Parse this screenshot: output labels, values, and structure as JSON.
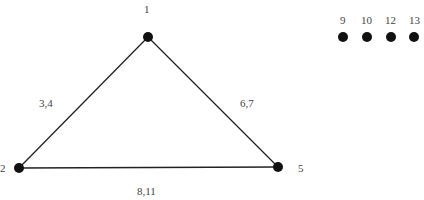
{
  "graph": {
    "nodes": [
      {
        "id": "1",
        "label": "1",
        "x": 148,
        "y": 37
      },
      {
        "id": "2",
        "label": "2",
        "x": 19,
        "y": 168
      },
      {
        "id": "5",
        "label": "5",
        "x": 278,
        "y": 167
      },
      {
        "id": "9",
        "label": "9",
        "x": 343,
        "y": 37
      },
      {
        "id": "10",
        "label": "10",
        "x": 367,
        "y": 37
      },
      {
        "id": "12",
        "label": "12",
        "x": 391,
        "y": 37
      },
      {
        "id": "13",
        "label": "13",
        "x": 414,
        "y": 37
      }
    ],
    "edges": [
      {
        "from": "1",
        "to": "2",
        "label": "3,4"
      },
      {
        "from": "1",
        "to": "5",
        "label": "6,7"
      },
      {
        "from": "2",
        "to": "5",
        "label": "8,11"
      }
    ],
    "color": "#111111"
  }
}
